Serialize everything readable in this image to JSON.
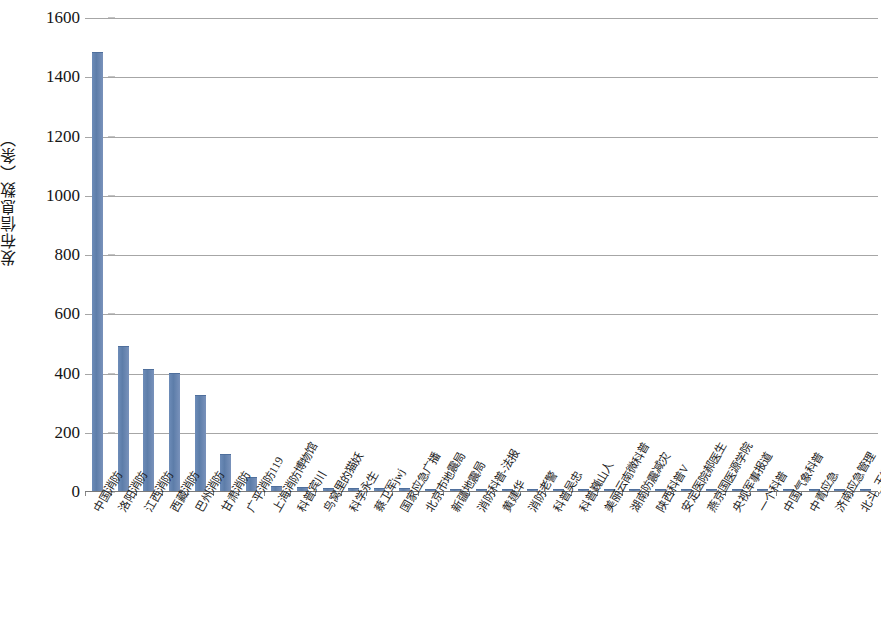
{
  "chart_data": {
    "type": "bar",
    "title": "",
    "subtitle": "",
    "xlabel": "",
    "ylabel": "发布信息数（条）",
    "ylim": [
      0,
      1600
    ],
    "ytick_step": 200,
    "yticks": [
      "0",
      "200",
      "400",
      "600",
      "800",
      "1000",
      "1200",
      "1400",
      "1600"
    ],
    "grid": true,
    "legend": "none",
    "bar_color": "#6a89b4",
    "gridline_color": "#a6a6a6",
    "categories": [
      "中国消防",
      "洛阳消防",
      "江西消防",
      "西藏消防",
      "巴州消防",
      "甘肃消防",
      "广平消防119",
      "上海消防博物馆",
      "科普宾川",
      "鸟窝里的猫妖",
      "科学永生",
      "蔡卫军jwj",
      "国家应急广播",
      "北京市地震局",
      "新疆地震局",
      "消防科普-法报",
      "黄建华",
      "消防老警",
      "科普吴忠",
      "科普巍山人",
      "美丽云南微科普",
      "湖南防震减灾",
      "陕西科普V",
      "安定医院郝医生",
      "燕京国医源学院",
      "央视军事报道",
      "一个科普",
      "中国气象科普",
      "中青应急",
      "济南应急管理",
      "北斗_玉衡"
    ],
    "values": [
      1480,
      485,
      410,
      395,
      320,
      120,
      45,
      12,
      10,
      8,
      7,
      6,
      6,
      5,
      5,
      5,
      4,
      4,
      4,
      4,
      3,
      3,
      3,
      3,
      3,
      3,
      2,
      2,
      2,
      2,
      2
    ]
  }
}
